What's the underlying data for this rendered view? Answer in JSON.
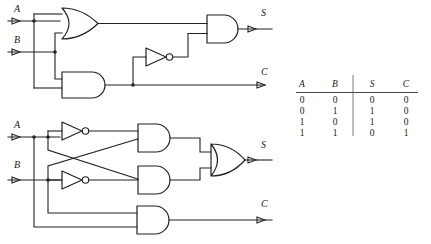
{
  "figure": {
    "line_color": "#222222",
    "background": "#ffffff"
  },
  "circuit_top": {
    "name": "half-adder-or-and-not-and",
    "inputs": [
      {
        "label": "A",
        "x": 14,
        "y": 12
      },
      {
        "label": "B",
        "x": 14,
        "y": 43
      }
    ],
    "outputs": [
      {
        "label": "S",
        "x": 261,
        "y": 16
      },
      {
        "label": "C",
        "x": 261,
        "y": 75
      }
    ],
    "gates": [
      {
        "type": "or",
        "name": "or-gate-top"
      },
      {
        "type": "and",
        "name": "and-gate-top-lower"
      },
      {
        "type": "not",
        "name": "not-gate-top"
      },
      {
        "type": "and",
        "name": "and-gate-top-output"
      }
    ]
  },
  "circuit_bottom": {
    "name": "half-adder-inverter-crossover",
    "inputs": [
      {
        "label": "A",
        "x": 14,
        "y": 128
      },
      {
        "label": "B",
        "x": 14,
        "y": 168
      }
    ],
    "outputs": [
      {
        "label": "S",
        "x": 261,
        "y": 148
      },
      {
        "label": "C",
        "x": 261,
        "y": 207
      }
    ],
    "gates": [
      {
        "type": "not",
        "name": "not-gate-a"
      },
      {
        "type": "not",
        "name": "not-gate-b"
      },
      {
        "type": "and",
        "name": "and-gate-upper"
      },
      {
        "type": "and",
        "name": "and-gate-lower"
      },
      {
        "type": "or",
        "name": "or-gate-sum"
      },
      {
        "type": "and",
        "name": "and-gate-carry"
      }
    ]
  },
  "truth_table": {
    "name": "half-adder-truth-table",
    "headers": [
      "A",
      "B",
      "S",
      "C"
    ],
    "rows": [
      [
        "0",
        "0",
        "0",
        "0"
      ],
      [
        "0",
        "1",
        "1",
        "0"
      ],
      [
        "1",
        "0",
        "1",
        "0"
      ],
      [
        "1",
        "1",
        "0",
        "1"
      ]
    ]
  }
}
